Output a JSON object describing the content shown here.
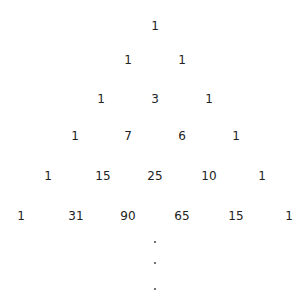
{
  "rows": [
    {
      "y": 26,
      "values": [
        "1"
      ],
      "xs": [
        155
      ]
    },
    {
      "y": 60,
      "values": [
        "1",
        "1"
      ],
      "xs": [
        128,
        182
      ]
    },
    {
      "y": 99,
      "values": [
        "1",
        "3",
        "1"
      ],
      "xs": [
        101,
        155,
        209
      ]
    },
    {
      "y": 136,
      "values": [
        "1",
        "7",
        "6",
        "1"
      ],
      "xs": [
        75,
        128,
        182,
        236
      ]
    },
    {
      "y": 176,
      "values": [
        "1",
        "15",
        "25",
        "10",
        "1"
      ],
      "xs": [
        48,
        103,
        155,
        209,
        262
      ]
    },
    {
      "y": 216,
      "values": [
        "1",
        "31",
        "90",
        "65",
        "15",
        "1"
      ],
      "xs": [
        21,
        76,
        128,
        182,
        236,
        289
      ]
    }
  ],
  "ellipsis": {
    "x": 155,
    "ys": [
      242,
      263,
      289
    ]
  }
}
